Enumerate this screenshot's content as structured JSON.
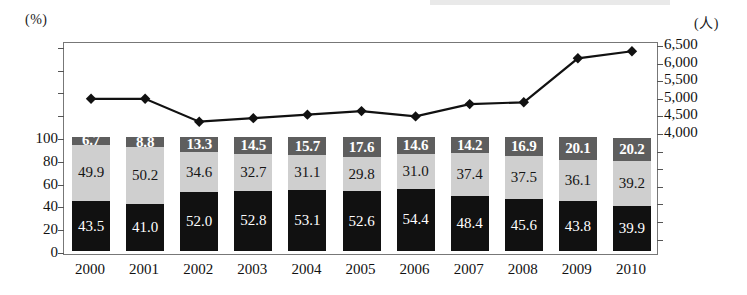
{
  "axis": {
    "left_unit": "(%)",
    "right_unit": "(人)",
    "left_ticks": [
      "100",
      "80",
      "60",
      "40",
      "20",
      "0"
    ],
    "right_ticks": [
      "6,500",
      "6,000",
      "5,500",
      "5,000",
      "4,500",
      "4,000"
    ]
  },
  "chart_data": {
    "type": "bar",
    "title": "",
    "subtitle": "",
    "xlabel": "",
    "ylabel": "(%)",
    "y2label": "(人)",
    "grid": false,
    "legend": "none",
    "stacked": true,
    "categories": [
      "2000",
      "2001",
      "2002",
      "2003",
      "2004",
      "2005",
      "2006",
      "2007",
      "2008",
      "2009",
      "2010"
    ],
    "ylim": [
      0,
      100
    ],
    "y2lim": [
      4000,
      6500
    ],
    "series": [
      {
        "name": "bottom-segment",
        "color": "#111111",
        "axis": "left",
        "values": [
          43.5,
          41.0,
          52.0,
          52.8,
          53.1,
          52.6,
          54.4,
          48.4,
          45.6,
          43.8,
          39.9
        ]
      },
      {
        "name": "middle-segment",
        "color": "#cfcfcf",
        "axis": "left",
        "values": [
          49.9,
          50.2,
          34.6,
          32.7,
          31.1,
          29.8,
          31.0,
          37.4,
          37.5,
          36.1,
          39.2
        ]
      },
      {
        "name": "top-segment",
        "color": "#5e5e5e",
        "axis": "left",
        "values": [
          6.7,
          8.8,
          13.3,
          14.5,
          15.7,
          17.6,
          14.6,
          14.2,
          16.9,
          20.1,
          20.2
        ]
      },
      {
        "name": "line-series",
        "type": "line",
        "color": "#111111",
        "marker": "diamond",
        "axis": "right",
        "values": [
          5000,
          5000,
          4350,
          4450,
          4550,
          4650,
          4500,
          4850,
          4900,
          6150,
          6350
        ]
      }
    ]
  }
}
